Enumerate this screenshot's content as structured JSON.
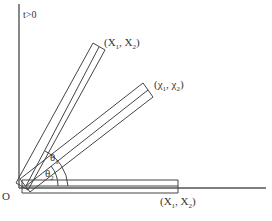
{
  "diagram": {
    "axis_label_vertical": "t>0",
    "origin_label": "O",
    "angle_labels": {
      "theta1": "θ",
      "theta1_sub": "1",
      "theta2": "θ",
      "theta2_sub": "2"
    },
    "bars": [
      {
        "name": "upper",
        "label_open": "(X",
        "label_sub1": "1",
        "label_mid": ", X",
        "label_sub2": "2",
        "label_close": ")"
      },
      {
        "name": "middle",
        "label_open": "(χ",
        "label_sub1": "1",
        "label_mid": ", χ",
        "label_sub2": "2",
        "label_close": ")"
      },
      {
        "name": "horizontal",
        "label_open": "(X",
        "label_sub1": "1",
        "label_mid": ", X",
        "label_sub2": "2",
        "label_close": ")"
      }
    ],
    "colors": {
      "line": "#444444",
      "text": "#333333",
      "background": "#ffffff"
    }
  }
}
